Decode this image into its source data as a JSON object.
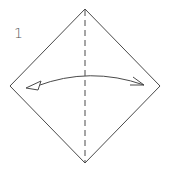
{
  "diagram": {
    "step_number": "1",
    "paper_shape": "square-diamond",
    "fold_line": "valley-fold-vertical-dashed",
    "arrow": "fold-and-unfold",
    "colors": {
      "line": "#4a4a4a",
      "background": "#ffffff"
    }
  }
}
